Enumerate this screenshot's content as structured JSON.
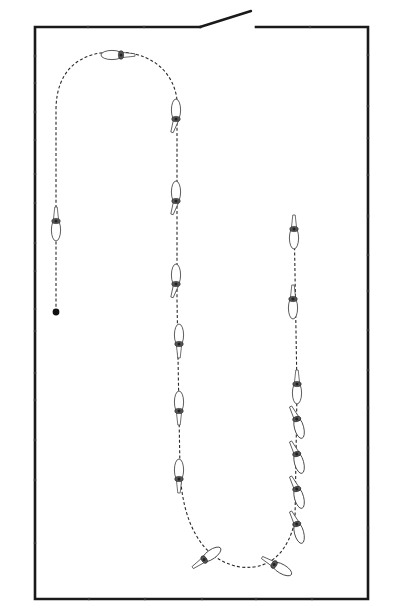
{
  "diagram": {
    "type": "riding-arena-pattern",
    "arena": {
      "left": 35,
      "top": 27,
      "right": 368,
      "bottom": 599,
      "wall_color": "#1a1a1a"
    },
    "gate": {
      "opening_from_x": 200,
      "opening_to_x": 256,
      "open_door_end": {
        "x": 251,
        "y": 11
      }
    },
    "wall_markers": {
      "top": [
        88,
        144,
        310
      ],
      "bottom": [
        89,
        145,
        202,
        256,
        312
      ],
      "left": [
        56,
        83,
        112,
        140,
        174,
        203,
        243,
        271,
        309,
        331,
        373,
        400,
        440,
        480,
        543
      ],
      "right": [
        55,
        106,
        138,
        175,
        216,
        255,
        291,
        330,
        370,
        408,
        448,
        488,
        528
      ]
    },
    "start_marker": {
      "x": 56,
      "y": 312,
      "label": "start-point"
    },
    "path_color": "#2a2a2a",
    "figure_count": 19,
    "figures": [
      {
        "id": "h1",
        "x": 56,
        "y": 222,
        "rot": 0,
        "lean": 0
      },
      {
        "id": "h2",
        "x": 120,
        "y": 55,
        "rot": 90,
        "lean": 0
      },
      {
        "id": "h3",
        "x": 176,
        "y": 118,
        "rot": 180,
        "lean": 18
      },
      {
        "id": "h4",
        "x": 176,
        "y": 200,
        "rot": 180,
        "lean": 18
      },
      {
        "id": "h5",
        "x": 176,
        "y": 283,
        "rot": 180,
        "lean": 18
      },
      {
        "id": "h6",
        "x": 179,
        "y": 343,
        "rot": 180,
        "lean": 0
      },
      {
        "id": "h7",
        "x": 179,
        "y": 410,
        "rot": 180,
        "lean": 0
      },
      {
        "id": "h8",
        "x": 179,
        "y": 478,
        "rot": 180,
        "lean": 0
      },
      {
        "id": "h9",
        "x": 205,
        "y": 559,
        "rot": 235,
        "lean": 0
      },
      {
        "id": "h10",
        "x": 275,
        "y": 565,
        "rot": 300,
        "lean": 0
      },
      {
        "id": "h11",
        "x": 297,
        "y": 525,
        "rot": 345,
        "lean": -12
      },
      {
        "id": "h12",
        "x": 297,
        "y": 490,
        "rot": 345,
        "lean": -12
      },
      {
        "id": "h13",
        "x": 297,
        "y": 455,
        "rot": 345,
        "lean": -12
      },
      {
        "id": "h14",
        "x": 297,
        "y": 420,
        "rot": 345,
        "lean": -12
      },
      {
        "id": "h15",
        "x": 297,
        "y": 385,
        "rot": 0,
        "lean": 0
      },
      {
        "id": "h16",
        "x": 293,
        "y": 300,
        "rot": 0,
        "lean": 0
      },
      {
        "id": "h17",
        "x": 294,
        "y": 230,
        "rot": 0,
        "lean": 0
      }
    ],
    "segments": [
      "straight line from start point up the left long side",
      "half-circle across the top end",
      "leg-yield / shoulder-in down the centre line",
      "half-circle across the bottom end",
      "half-pass / travers up the right quarter line, ending straight"
    ]
  }
}
